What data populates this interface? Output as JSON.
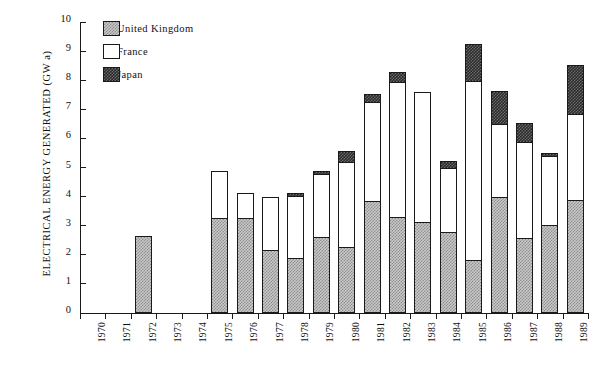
{
  "chart_data": {
    "type": "bar",
    "stacked": true,
    "title": "",
    "xlabel": "",
    "ylabel": "ELECTRICAL ENERGY GENERATED (GW a)",
    "ylim": [
      0,
      10
    ],
    "ytick_labels": [
      "0",
      "1",
      "2",
      "3",
      "4",
      "5",
      "6",
      "7",
      "8",
      "9",
      "10"
    ],
    "grid": false,
    "legend_position": "top-left",
    "categories": [
      "1970",
      "1971",
      "1972",
      "1973",
      "1974",
      "1975",
      "1976",
      "1977",
      "1978",
      "1979",
      "1980",
      "1981",
      "1982",
      "1983",
      "1984",
      "1985",
      "1986",
      "1987",
      "1988",
      "1989"
    ],
    "series": [
      {
        "name": "United Kingdom",
        "color": "#c8c8c8",
        "pattern": "light-checker",
        "values": [
          0,
          0,
          2.62,
          0,
          0,
          3.22,
          3.23,
          2.13,
          1.85,
          2.57,
          2.25,
          3.8,
          3.25,
          3.1,
          2.75,
          1.8,
          3.95,
          2.55,
          3.0,
          3.85
        ]
      },
      {
        "name": "France",
        "color": "#ffffff",
        "pattern": "solid-white",
        "values": [
          0,
          0,
          0,
          0,
          0,
          1.63,
          0.87,
          1.84,
          2.15,
          2.18,
          2.9,
          3.4,
          4.65,
          4.45,
          2.2,
          6.15,
          2.5,
          3.3,
          2.35,
          2.95
        ]
      },
      {
        "name": "Japan",
        "color": "#2a2a2a",
        "pattern": "dark-checker",
        "values": [
          0,
          0,
          0,
          0,
          0,
          0,
          0,
          0,
          0.08,
          0.1,
          0.4,
          0.3,
          0.35,
          0,
          0.25,
          1.25,
          1.15,
          0.65,
          0.1,
          1.7
        ]
      }
    ],
    "totals": [
      0,
      0,
      2.62,
      0,
      0,
      4.85,
      4.1,
      3.97,
      4.08,
      4.85,
      5.55,
      7.5,
      8.25,
      7.55,
      5.2,
      9.2,
      7.6,
      6.5,
      5.45,
      8.5
    ]
  },
  "legend": {
    "items": [
      {
        "label": "United Kingdom",
        "swatch": "uk"
      },
      {
        "label": "France",
        "swatch": "fr"
      },
      {
        "label": "Japan",
        "swatch": "jp"
      }
    ]
  }
}
